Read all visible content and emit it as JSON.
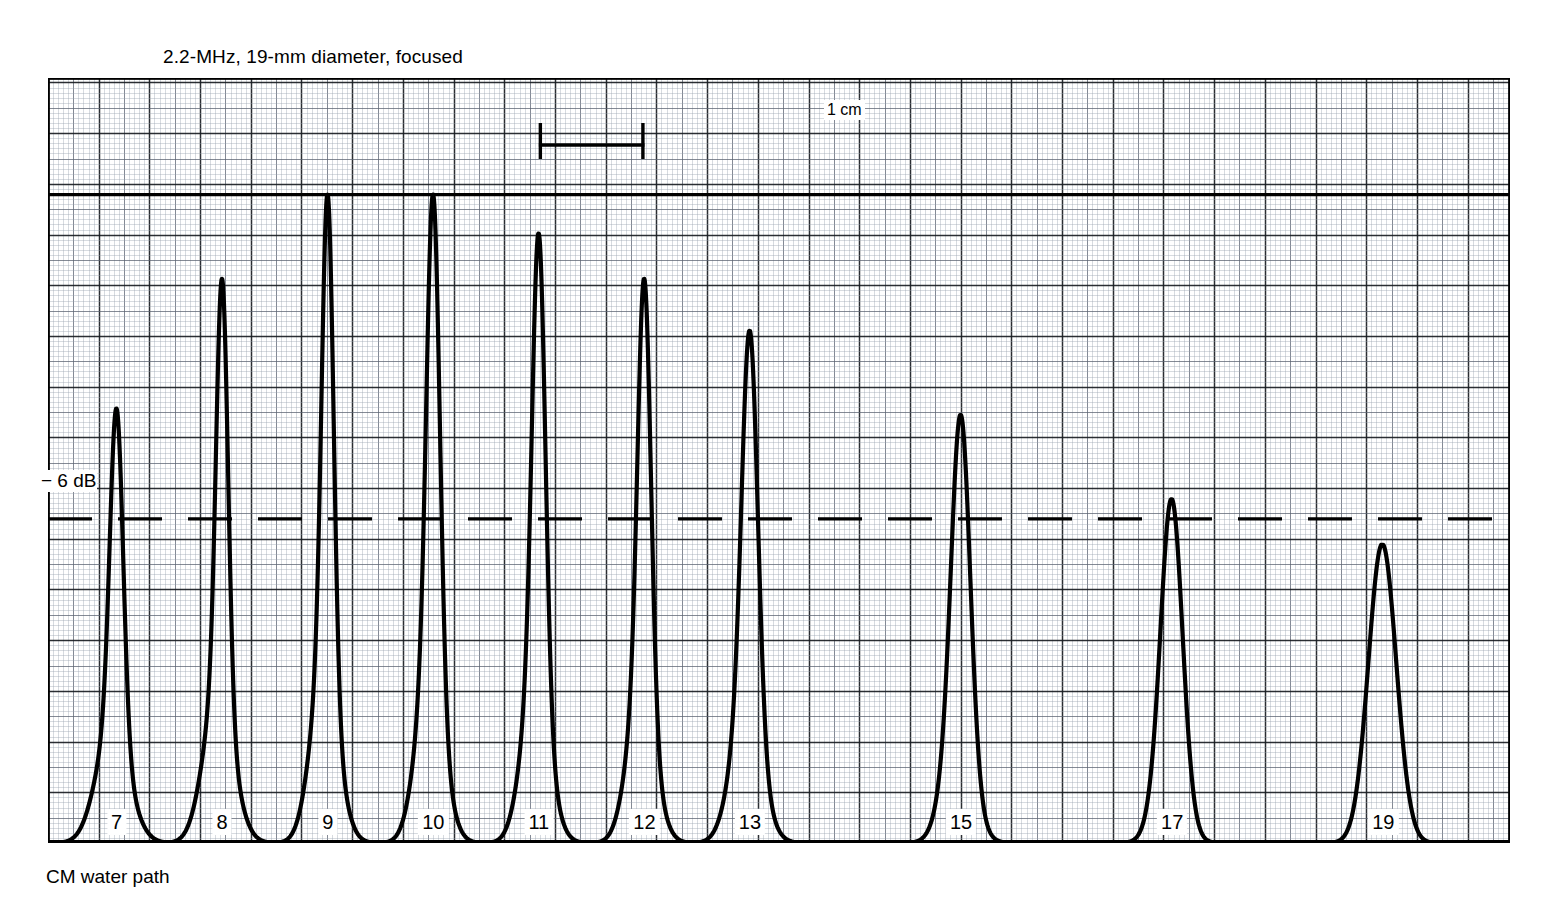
{
  "title": "2.2-MHz, 19-mm diameter, focused",
  "axis": {
    "x_label": "CM water path",
    "db_label": "− 6 dB",
    "scalebar_label": "1 cm"
  },
  "chart_data": {
    "type": "line",
    "title": "2.2-MHz, 19-mm diameter, focused",
    "xlabel": "CM water path",
    "ylabel": "",
    "grid": true,
    "legend": "none",
    "xlim": [
      6.35,
      20.2
    ],
    "ylim": [
      0,
      118
    ],
    "x_tick_labels": [
      "7",
      "8",
      "9",
      "10",
      "11",
      "12",
      "13",
      "15",
      "17",
      "19"
    ],
    "x_tick_positions_cm": [
      7,
      8,
      9,
      10,
      11,
      12,
      13,
      15,
      17,
      19
    ],
    "reference_lines": [
      {
        "name": "peak-100-percent-line",
        "y": 100,
        "style": "solid",
        "weight": "heavy"
      },
      {
        "name": "minus-6-db-line",
        "y": 50,
        "style": "dashed",
        "weight": "heavy",
        "label": "− 6 dB"
      }
    ],
    "scalebar": {
      "label": "1 cm",
      "length_cm": 1
    },
    "series": [
      {
        "name": "echo-amplitude",
        "peaks": [
          {
            "label": "7",
            "x_cm": 7.0,
            "amplitude_pct": 67,
            "half_width_cm": 0.1,
            "base_width_cm": 0.52
          },
          {
            "label": "8",
            "x_cm": 8.0,
            "amplitude_pct": 87,
            "half_width_cm": 0.09,
            "base_width_cm": 0.48
          },
          {
            "label": "9",
            "x_cm": 9.0,
            "amplitude_pct": 100,
            "half_width_cm": 0.09,
            "base_width_cm": 0.44
          },
          {
            "label": "10",
            "x_cm": 10.0,
            "amplitude_pct": 100,
            "half_width_cm": 0.1,
            "base_width_cm": 0.44
          },
          {
            "label": "11",
            "x_cm": 11.0,
            "amplitude_pct": 94,
            "half_width_cm": 0.1,
            "base_width_cm": 0.44
          },
          {
            "label": "12",
            "x_cm": 12.0,
            "amplitude_pct": 87,
            "half_width_cm": 0.1,
            "base_width_cm": 0.44
          },
          {
            "label": "13",
            "x_cm": 13.0,
            "amplitude_pct": 79,
            "half_width_cm": 0.12,
            "base_width_cm": 0.48
          },
          {
            "label": "15",
            "x_cm": 15.0,
            "amplitude_pct": 66,
            "half_width_cm": 0.14,
            "base_width_cm": 0.46
          },
          {
            "label": "17",
            "x_cm": 17.0,
            "amplitude_pct": 53,
            "half_width_cm": 0.16,
            "base_width_cm": 0.44
          },
          {
            "label": "19",
            "x_cm": 19.0,
            "amplitude_pct": 46,
            "half_width_cm": 0.21,
            "base_width_cm": 0.46
          }
        ]
      }
    ]
  },
  "colors": {
    "ink": "#000000",
    "grid_fine": "#9aa3b0",
    "grid_medium": "#5b6472",
    "grid_major": "#1a1d22",
    "background": "#ffffff"
  }
}
